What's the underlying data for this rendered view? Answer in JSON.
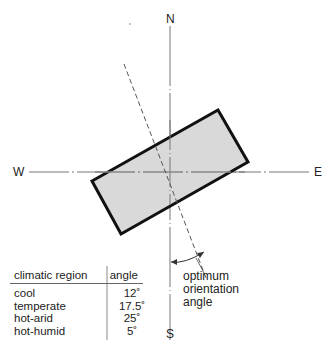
{
  "compass": {
    "north": "N",
    "south": "S",
    "east": "E",
    "west": "W"
  },
  "annotation": {
    "line1": "optimum",
    "line2": "orientation",
    "line3": "angle"
  },
  "table": {
    "headers": [
      "climatic region",
      "angle"
    ],
    "rows": [
      {
        "region": "cool",
        "angle": "12˚"
      },
      {
        "region": "temperate",
        "angle": "17.5˚"
      },
      {
        "region": "hot-arid",
        "angle": "25˚"
      },
      {
        "region": "hot-humid",
        "angle": "5˚"
      }
    ]
  },
  "colors": {
    "building_fill": "#d9d9d9",
    "outline": "#111111",
    "axis": "#777777"
  }
}
